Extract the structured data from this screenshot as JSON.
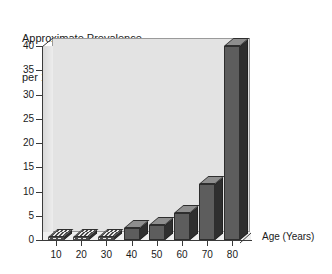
{
  "chart_data": {
    "type": "bar",
    "title": "Approximate Prevalence\nper 100 population",
    "title_line1": "Approximate Prevalence",
    "title_line2": "per 100 population",
    "xlabel": "Age (Years)",
    "ylabel": "",
    "categories": [
      "10",
      "20",
      "30",
      "40",
      "50",
      "60",
      "70",
      "80"
    ],
    "values": [
      0.2,
      0.2,
      0.3,
      2.5,
      3,
      5.5,
      11.5,
      40
    ],
    "xlim": [
      5,
      85
    ],
    "ylim": [
      0,
      40
    ],
    "ytick_labels": [
      "0",
      "5",
      "10",
      "15",
      "20",
      "25",
      "30",
      "35",
      "40"
    ],
    "ytick_values": [
      0,
      5,
      10,
      15,
      20,
      25,
      30,
      35,
      40
    ],
    "grid": false,
    "legend": "none",
    "style": "3d-bar",
    "colors": {
      "bar_front": "#5d5d5d",
      "bar_side": "#2f2f2f",
      "bar_top": "#8e8e8e",
      "plot_background": "#e3e3e3",
      "axis": "#3a3a3a",
      "text": "#1a1a1a",
      "page_background": "#ffffff"
    }
  }
}
